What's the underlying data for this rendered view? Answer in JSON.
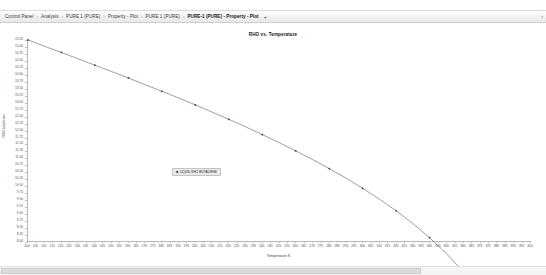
{
  "window": {
    "title": "PURE-1 (PURE) - Property - Plot"
  },
  "tabs": {
    "separator": "›",
    "items": [
      {
        "label": "Control Panel",
        "active": false
      },
      {
        "label": "Analysis",
        "active": false
      },
      {
        "label": "PURE 1 (PURE)",
        "active": false
      },
      {
        "label": "Property - Plot",
        "active": false
      },
      {
        "label": "PURE 1 (PURE)",
        "active": false
      },
      {
        "label": "PURE-1 (PURE) - Property - Plot",
        "active": true
      }
    ],
    "add_tab_label": "+",
    "overflow_arrow": "›"
  },
  "legend": {
    "marker_color": "#3b3b6e",
    "label": "LIQUID RHO BUTADIENE"
  },
  "colors": {
    "series_line": "#5a5a70",
    "marker": "#3b3b6e",
    "axis": "#b9b9b9",
    "tick_text": "#4d4d4d",
    "title_text": "#1a1a1a",
    "panel_background": "#ffffff"
  },
  "chart_data": {
    "type": "line",
    "title": "RHO vs. Temperature",
    "xlabel": "Temperature K",
    "ylabel": "RHO kmol/cum",
    "xlim": [
      100,
      400
    ],
    "ylim": [
      8.0,
      15.25
    ],
    "grid": false,
    "legend_position": "inside-center-left",
    "x_ticks": [
      100,
      105,
      110,
      115,
      120,
      125,
      130,
      135,
      140,
      145,
      150,
      155,
      160,
      165,
      170,
      175,
      180,
      185,
      190,
      195,
      200,
      205,
      210,
      215,
      220,
      225,
      230,
      235,
      240,
      245,
      250,
      255,
      260,
      265,
      270,
      275,
      280,
      285,
      290,
      295,
      300,
      305,
      310,
      315,
      320,
      325,
      330,
      335,
      340,
      345,
      350,
      355,
      360,
      365,
      370,
      375,
      380,
      385,
      390,
      395,
      400
    ],
    "y_ticks": [
      15.25,
      15.0,
      14.75,
      14.5,
      14.25,
      14.0,
      13.75,
      13.5,
      13.25,
      13.0,
      12.75,
      12.5,
      12.25,
      12.0,
      11.75,
      11.5,
      11.25,
      11.0,
      10.75,
      10.5,
      10.25,
      10.0,
      9.75,
      9.5,
      9.25,
      9.0,
      8.75,
      8.5,
      8.25,
      8.0
    ],
    "series": [
      {
        "name": "LIQUID RHO BUTADIENE",
        "x": [
          100,
          110,
          120,
          130,
          140,
          150,
          160,
          170,
          180,
          190,
          200,
          210,
          220,
          230,
          240,
          250,
          260,
          270,
          280,
          290,
          300,
          310,
          320,
          330,
          340,
          350,
          360,
          370,
          380,
          390,
          395,
          400
        ],
        "y": [
          15.25,
          15.02,
          14.8,
          14.57,
          14.34,
          14.11,
          13.88,
          13.64,
          13.4,
          13.16,
          12.91,
          12.65,
          12.39,
          12.12,
          11.84,
          11.55,
          11.25,
          10.94,
          10.61,
          10.27,
          9.9,
          9.51,
          9.09,
          8.63,
          8.12,
          7.55,
          6.9,
          6.12,
          5.1,
          3.55,
          2.4,
          1.1
        ]
      }
    ]
  }
}
